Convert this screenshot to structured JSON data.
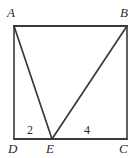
{
  "figure": {
    "kind": "geometry-diagram",
    "canvas": {
      "width": 136,
      "height": 158
    },
    "colors": {
      "background": "#ffffff",
      "stroke": "#3a3a3a",
      "text": "#2b2b2b"
    },
    "stroke_width": 1.6,
    "points": {
      "A": {
        "x": 14,
        "y": 26
      },
      "B": {
        "x": 127,
        "y": 26
      },
      "C": {
        "x": 127,
        "y": 139
      },
      "D": {
        "x": 14,
        "y": 139
      },
      "E": {
        "x": 52,
        "y": 139
      }
    },
    "vertex_labels": [
      {
        "id": "A",
        "text": "A"
      },
      {
        "id": "B",
        "text": "B"
      },
      {
        "id": "C",
        "text": "C"
      },
      {
        "id": "D",
        "text": "D"
      },
      {
        "id": "E",
        "text": "E"
      }
    ],
    "segment_labels": [
      {
        "id": "DE",
        "text": "2",
        "segment": "D-E"
      },
      {
        "id": "EC",
        "text": "4",
        "segment": "E-C"
      }
    ],
    "edges": [
      {
        "id": "AB",
        "from": "A",
        "to": "B"
      },
      {
        "id": "BC",
        "from": "B",
        "to": "C"
      },
      {
        "id": "DC",
        "from": "D",
        "to": "C"
      },
      {
        "id": "AD",
        "from": "A",
        "to": "D"
      },
      {
        "id": "AE",
        "from": "A",
        "to": "E"
      },
      {
        "id": "BE",
        "from": "B",
        "to": "E"
      }
    ]
  }
}
